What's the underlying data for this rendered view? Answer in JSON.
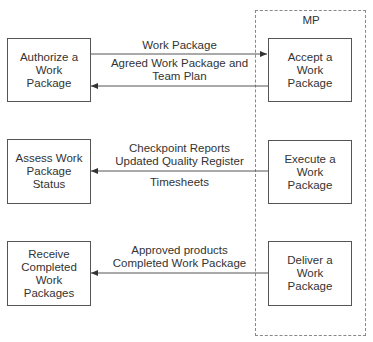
{
  "container": {
    "label": "MP"
  },
  "left_boxes": [
    {
      "label": "Authorize a Work Package"
    },
    {
      "label": "Assess Work Package Status"
    },
    {
      "label": "Receive Completed Work Packages"
    }
  ],
  "right_boxes": [
    {
      "label": "Accept a Work Package"
    },
    {
      "label": "Execute a Work Package"
    },
    {
      "label": "Deliver a Work Package"
    }
  ],
  "flows": [
    {
      "direction": "right",
      "label": "Work Package"
    },
    {
      "direction": "left",
      "label_line1": "Agreed Work Package and",
      "label_line2": "Team Plan"
    },
    {
      "direction": "left",
      "label_line1": "Checkpoint Reports",
      "label_line2": "Updated Quality Register",
      "label_below": "Timesheets"
    },
    {
      "direction": "left",
      "label_line1": "Approved products",
      "label_line2": "Completed Work Package"
    }
  ],
  "colors": {
    "line": "#555555",
    "dashed": "#888888",
    "text": "#333333"
  }
}
